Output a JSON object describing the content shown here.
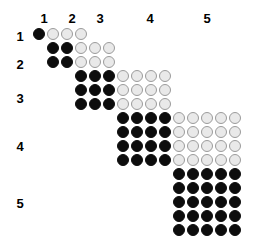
{
  "figure": {
    "title": "",
    "background_color": "#ffffff",
    "filled_color": "#0d0d0d",
    "empty_fill_color": "#e9e9e9",
    "empty_stroke_color": "#9b9b9b"
  },
  "column_headers": [
    {
      "label": "1",
      "x": 37,
      "y": 12
    },
    {
      "label": "2",
      "x": 65,
      "y": 12
    },
    {
      "label": "3",
      "x": 93,
      "y": 12
    },
    {
      "label": "4",
      "x": 143,
      "y": 12
    },
    {
      "label": "5",
      "x": 200,
      "y": 12
    }
  ],
  "row_headers": [
    {
      "label": "1",
      "x": 13,
      "y": 30
    },
    {
      "label": "2",
      "x": 13,
      "y": 58
    },
    {
      "label": "3",
      "x": 13,
      "y": 92
    },
    {
      "label": "4",
      "x": 13,
      "y": 140
    },
    {
      "label": "5",
      "x": 13,
      "y": 197
    }
  ],
  "chart_data": {
    "type": "heatmap",
    "title": "",
    "xlabel": "",
    "ylabel": "",
    "grid": {
      "pitch_x": 14,
      "pitch_y": 14,
      "circle_diameter": 12,
      "origin_x": 33,
      "origin_y": 28
    },
    "categories": [
      "1",
      "2",
      "3",
      "4",
      "5"
    ],
    "legend": [
      {
        "name": "filled",
        "symbol": "black-circle",
        "color": "#0d0d0d"
      },
      {
        "name": "unfilled",
        "symbol": "light-grey-circle",
        "color": "#e9e9e9"
      }
    ],
    "blocks": [
      {
        "label": "1",
        "start_col": 0,
        "start_row": 0,
        "rows": 1,
        "filled_cols": 1,
        "empty_cols": 3
      },
      {
        "label": "2",
        "start_col": 1,
        "start_row": 1,
        "rows": 2,
        "filled_cols": 2,
        "empty_cols": 3
      },
      {
        "label": "3",
        "start_col": 3,
        "start_row": 3,
        "rows": 3,
        "filled_cols": 3,
        "empty_cols": 4
      },
      {
        "label": "4",
        "start_col": 6,
        "start_row": 6,
        "rows": 4,
        "filled_cols": 4,
        "empty_cols": 5
      },
      {
        "label": "5",
        "start_col": 10,
        "start_row": 10,
        "rows": 5,
        "filled_cols": 5,
        "empty_cols": 0
      }
    ],
    "totals": {
      "filled_circles": 55,
      "empty_circles": 48,
      "rows": 15,
      "columns": 15
    }
  }
}
